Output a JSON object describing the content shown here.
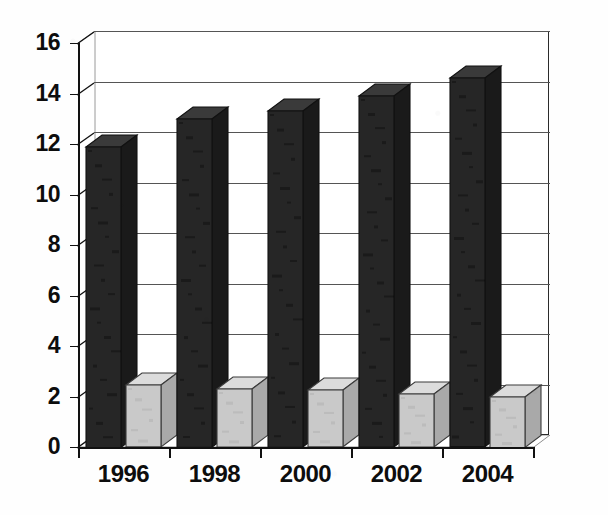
{
  "chart_data": {
    "type": "bar",
    "title": "",
    "subtitle": "",
    "xlabel": "",
    "ylabel": "",
    "categories": [
      "1996",
      "1998",
      "2000",
      "2002",
      "2004"
    ],
    "series": [
      {
        "name": "series-dark",
        "color": "#262626",
        "values": [
          11.9,
          13.0,
          13.3,
          13.9,
          14.6
        ]
      },
      {
        "name": "series-light",
        "color": "#c9c9c9",
        "values": [
          2.45,
          2.3,
          2.25,
          2.1,
          2.0
        ]
      }
    ],
    "ylim": [
      0,
      16
    ],
    "ytick_step": 2,
    "yticks": [
      "0",
      "2",
      "4",
      "6",
      "8",
      "10",
      "12",
      "14",
      "16"
    ],
    "grid": true,
    "grid_axis": "y",
    "legend": "none",
    "style": "3d-column",
    "background": "#ffffff",
    "axis_color": "#111111",
    "gridline_color": "#555555"
  },
  "axes": {
    "y_ticks": [
      {
        "label": "16",
        "value": 16
      },
      {
        "label": "14",
        "value": 14
      },
      {
        "label": "12",
        "value": 12
      },
      {
        "label": "10",
        "value": 10
      },
      {
        "label": "8",
        "value": 8
      },
      {
        "label": "6",
        "value": 6
      },
      {
        "label": "4",
        "value": 4
      },
      {
        "label": "2",
        "value": 2
      },
      {
        "label": "0",
        "value": 0
      }
    ],
    "x_ticks": [
      {
        "label": "1996"
      },
      {
        "label": "1998"
      },
      {
        "label": "2000"
      },
      {
        "label": "2002"
      },
      {
        "label": "2004"
      }
    ]
  }
}
